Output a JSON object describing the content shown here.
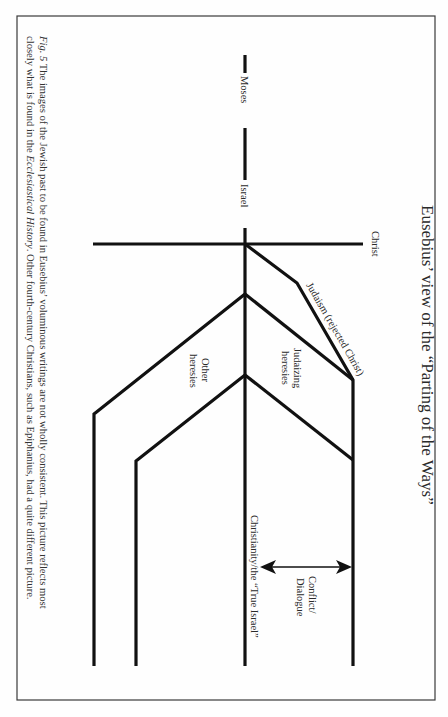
{
  "page": {
    "orientation": "rotated-90-clockwise",
    "running_header": "",
    "page_number": ""
  },
  "figure": {
    "title": "Eusebius’ view of the “Parting of the Ways”",
    "caption": {
      "label": "Fig. 5",
      "line1_a": " The images of the Jewish past to be found in Eusebius’ voluminous writings are not wholly consistent. This picture reflects most",
      "line2_a": "closely what is found in the ",
      "line2_italic": "Ecclesiastical History",
      "line2_b": ". Other fourth-century Christians, such as Epiphanius, had a quite different picture."
    },
    "labels": {
      "moses": "Moses",
      "israel": "Israel",
      "christ": "Christ",
      "judaism": "Judaism (rejected Christ)",
      "judaizing_1": "Judaizing",
      "judaizing_2": "heresies",
      "other_1": "Other",
      "other_2": "heresies",
      "christianity": "Christianity/the “True Israel”",
      "conflict_1": "Conflict/",
      "conflict_2": "Dialogue"
    },
    "colors": {
      "line": "#111111",
      "frame": "#3a3a3a",
      "text": "#2a2a2a"
    }
  }
}
